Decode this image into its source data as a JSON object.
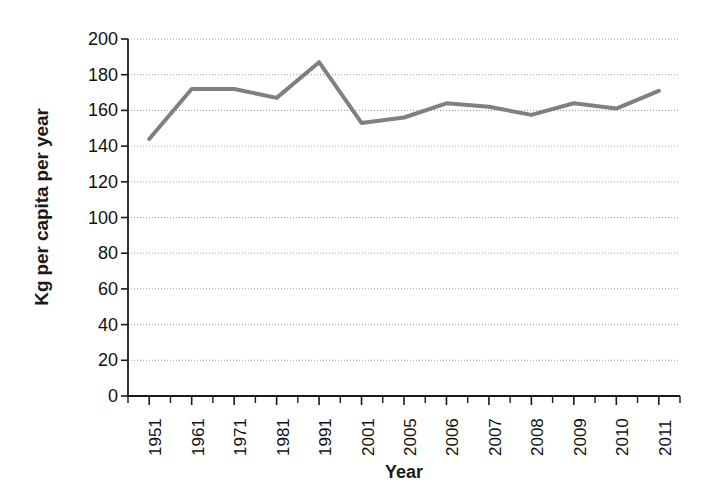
{
  "chart_data": {
    "type": "line",
    "title": "",
    "xlabel": "Year",
    "ylabel": "Kg per capita per year",
    "categories": [
      "1951",
      "1961",
      "1971",
      "1981",
      "1991",
      "2001",
      "2005",
      "2006",
      "2007",
      "2008",
      "2009",
      "2010",
      "2011"
    ],
    "values": [
      144,
      172,
      172,
      167,
      187,
      153,
      156,
      164,
      162,
      157.5,
      164,
      161,
      171
    ],
    "series": [
      {
        "name": "Kg per capita per year",
        "values": [
          144,
          172,
          172,
          167,
          187,
          153,
          156,
          164,
          162,
          157.5,
          164,
          161,
          171
        ]
      }
    ],
    "ylim": [
      0,
      200
    ],
    "yticks": [
      0,
      20,
      40,
      60,
      80,
      100,
      120,
      140,
      160,
      180,
      200
    ],
    "ytick_labels": [
      "0",
      "20",
      "40",
      "60",
      "80",
      "100",
      "120",
      "140",
      "160",
      "180",
      "200"
    ],
    "grid": true,
    "grid_style": "dotted-horizontal",
    "legend": false,
    "legend_position": "none",
    "line_color": "#808080",
    "line_width": 4,
    "axis_color": "#1a1a1a",
    "grid_color": "#999999",
    "background": "#ffffff"
  }
}
